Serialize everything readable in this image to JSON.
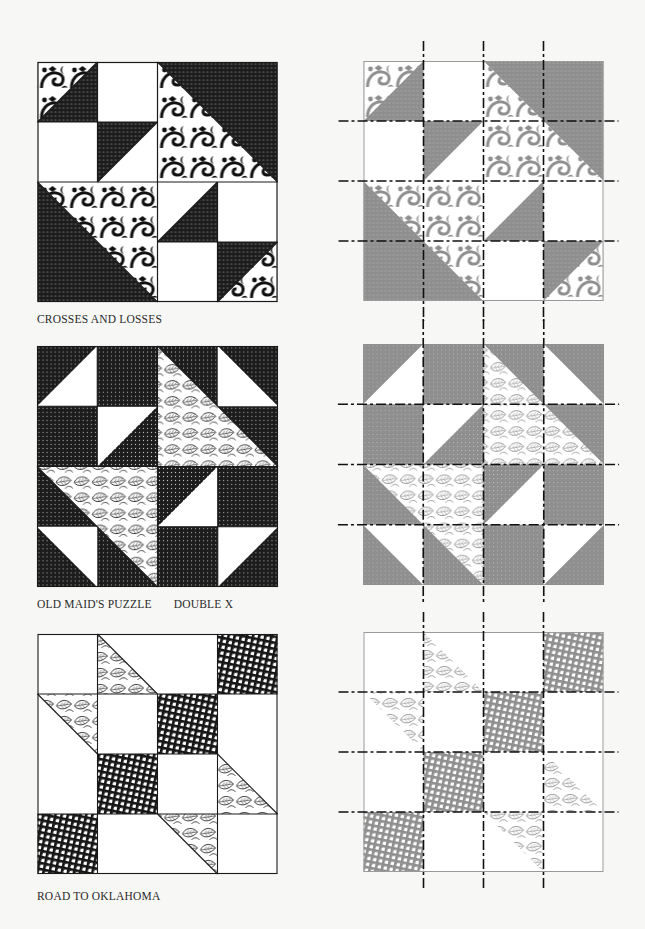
{
  "page": {
    "colors": {
      "background": "#f7f7f5",
      "dark_fabric": "#1c1c1c",
      "grey_fabric": "#8f8f8f",
      "light_fabric": "#ffffff",
      "outline": "#1a1a1a",
      "grey_outline": "#9a9a9a",
      "dash_line": "#111111"
    }
  },
  "blocks": [
    {
      "name": "Crosses and Losses",
      "caption": "CROSSES AND LOSSES",
      "grid": "4x4",
      "fabrics": [
        "dark dotted",
        "white",
        "black-on-white scroll print"
      ],
      "cut_lines": {
        "vertical": 3,
        "horizontal": 3
      }
    },
    {
      "name": "Old Maid's Puzzle / Double X",
      "caption_primary": "OLD MAID'S PUZZLE",
      "caption_secondary": "DOUBLE X",
      "grid": "4x4",
      "fabrics": [
        "dark dotted",
        "white",
        "leaf print"
      ],
      "cut_lines": {
        "vertical": 3,
        "horizontal": 3
      }
    },
    {
      "name": "Road to Oklahoma",
      "caption": "ROAD TO OKLAHOMA",
      "grid": "4x4",
      "fabrics": [
        "crosshatch plaid",
        "white",
        "leaf print"
      ],
      "cut_lines": {
        "vertical": 3,
        "horizontal": 3
      }
    }
  ]
}
